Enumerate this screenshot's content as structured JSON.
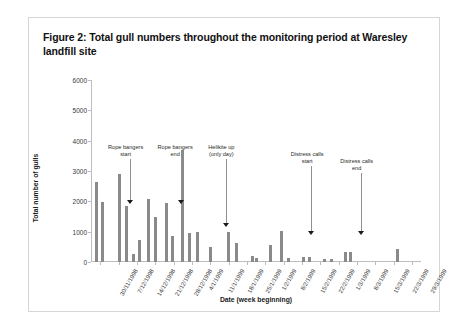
{
  "figure": {
    "title": "Figure 2: Total gull numbers throughout the monitoring period at Waresley landfill site"
  },
  "chart_data": {
    "type": "bar",
    "title": "Figure 2: Total gull numbers throughout the monitoring period at Waresley landfill site",
    "xlabel": "Date (week beginning)",
    "ylabel": "Total number of gulls",
    "ylim": [
      0,
      6000
    ],
    "ytick_values": [
      0,
      1000,
      2000,
      3000,
      4000,
      5000,
      6000
    ],
    "ytick_labels": [
      "0",
      "1000",
      "2000",
      "3000",
      "4000",
      "5000",
      "6000"
    ],
    "grid": false,
    "legend": "none",
    "categories": [
      "30/11/1998",
      "7/12/1998",
      "14/12/1998",
      "21/12/1998",
      "28/12/1998",
      "4/1/1999",
      "11/1/1999",
      "18/1/1999",
      "25/1/1999",
      "1/2/1999",
      "8/2/1999",
      "15/2/1999",
      "22/2/1999",
      "1/3/1999",
      "8/3/1999",
      "15/3/1999",
      "22/3/1999",
      "29/3/1999"
    ],
    "bars": [
      {
        "x": 0.1,
        "value": 2650
      },
      {
        "x": 0.45,
        "value": 1980
      },
      {
        "x": 1.35,
        "value": 2900
      },
      {
        "x": 1.75,
        "value": 1850
      },
      {
        "x": 2.1,
        "value": 260
      },
      {
        "x": 2.45,
        "value": 720
      },
      {
        "x": 2.95,
        "value": 2080
      },
      {
        "x": 3.35,
        "value": 1480
      },
      {
        "x": 3.95,
        "value": 1950
      },
      {
        "x": 4.25,
        "value": 870
      },
      {
        "x": 4.8,
        "value": 3700
      },
      {
        "x": 5.2,
        "value": 950
      },
      {
        "x": 5.6,
        "value": 980
      },
      {
        "x": 6.3,
        "value": 500
      },
      {
        "x": 7.3,
        "value": 980
      },
      {
        "x": 7.75,
        "value": 620
      },
      {
        "x": 8.6,
        "value": 210
      },
      {
        "x": 8.85,
        "value": 130
      },
      {
        "x": 9.6,
        "value": 560
      },
      {
        "x": 10.2,
        "value": 1020
      },
      {
        "x": 10.6,
        "value": 140
      },
      {
        "x": 11.4,
        "value": 170
      },
      {
        "x": 11.75,
        "value": 150
      },
      {
        "x": 12.55,
        "value": 90
      },
      {
        "x": 12.95,
        "value": 110
      },
      {
        "x": 13.7,
        "value": 330
      },
      {
        "x": 13.95,
        "value": 330
      },
      {
        "x": 16.55,
        "value": 420
      }
    ],
    "annotations": [
      {
        "name": "rope-bangers-start",
        "text": "Rope bangers\nstart",
        "label_x": 0.105,
        "label_y": 3900,
        "arrow_x": 0.118,
        "arrow_y": 1880
      },
      {
        "name": "rope-bangers-end",
        "text": "Rope bangers\nend",
        "label_x": 0.255,
        "label_y": 3900,
        "arrow_x": 0.272,
        "arrow_y": 1880
      },
      {
        "name": "helikite-up",
        "text": "Helikite up\n(only day)",
        "label_x": 0.395,
        "label_y": 3900,
        "arrow_x": 0.408,
        "arrow_y": 1130
      },
      {
        "name": "distress-calls-start",
        "text": "Distress calls\nstart",
        "label_x": 0.655,
        "label_y": 3650,
        "arrow_x": 0.666,
        "arrow_y": 880
      },
      {
        "name": "distress-calls-end",
        "text": "Distress calls\nend",
        "label_x": 0.805,
        "label_y": 3420,
        "arrow_x": 0.818,
        "arrow_y": 880
      }
    ]
  }
}
